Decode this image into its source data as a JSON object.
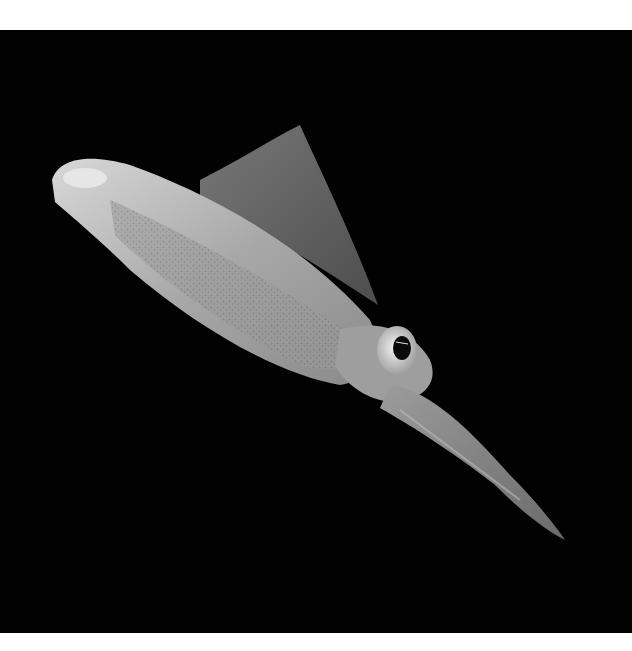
{
  "image": {
    "subject": "squid",
    "description": "Translucent squid photographed against a black background, swimming diagonally from upper-left to lower-right, with a large reflective eye and speckled mantle",
    "background_color": "#020202",
    "border_color": "#ffffff"
  }
}
